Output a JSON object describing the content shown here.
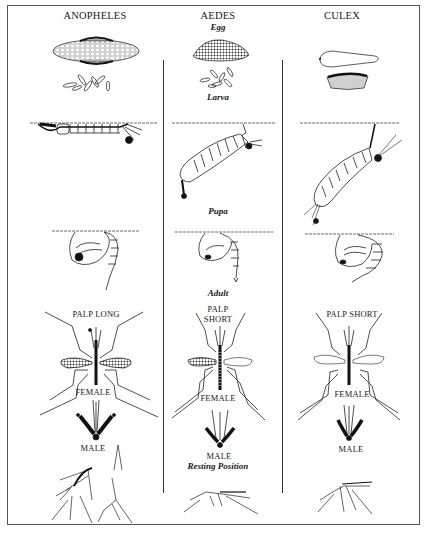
{
  "columns": [
    {
      "name": "ANOPHELES",
      "palp_label": "PALP LONG",
      "female_label": "FEMALE",
      "male_label": "MALE"
    },
    {
      "name": "AEDES",
      "palp_label_line1": "PALP",
      "palp_label_line2": "SHORT",
      "female_label": "FEMALE",
      "male_label": "MALE"
    },
    {
      "name": "CULEX",
      "palp_label": "PALP SHORT",
      "female_label": "FEMALE",
      "male_label": "MALE"
    }
  ],
  "stage_labels": {
    "egg": "Egg",
    "larva": "Larva",
    "pupa": "Pupa",
    "adult": "Adult",
    "resting": "Resting Position"
  }
}
